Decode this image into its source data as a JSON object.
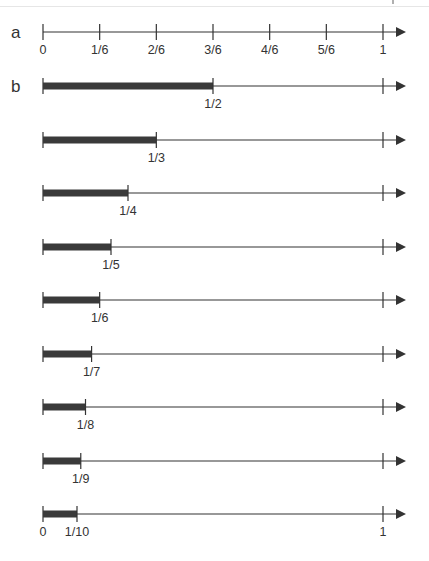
{
  "figure": {
    "panels": [
      {
        "label": "a",
        "type": "number-line",
        "ticks": [
          "0",
          "1/6",
          "2/6",
          "3/6",
          "4/6",
          "5/6",
          "1"
        ]
      },
      {
        "label": "b",
        "type": "unit-fraction-bars",
        "rows": [
          {
            "fraction": "1/2",
            "value": 0.5
          },
          {
            "fraction": "1/3",
            "value": 0.3333
          },
          {
            "fraction": "1/4",
            "value": 0.25
          },
          {
            "fraction": "1/5",
            "value": 0.2
          },
          {
            "fraction": "1/6",
            "value": 0.1667
          },
          {
            "fraction": "1/7",
            "value": 0.1429
          },
          {
            "fraction": "1/8",
            "value": 0.125
          },
          {
            "fraction": "1/9",
            "value": 0.1111
          },
          {
            "fraction": "1/10",
            "value": 0.1
          }
        ],
        "last_row_endpoints": [
          "0",
          "1"
        ]
      }
    ],
    "colors": {
      "line": "#333333",
      "bar": "#3a3a3a",
      "text": "#333333"
    }
  }
}
